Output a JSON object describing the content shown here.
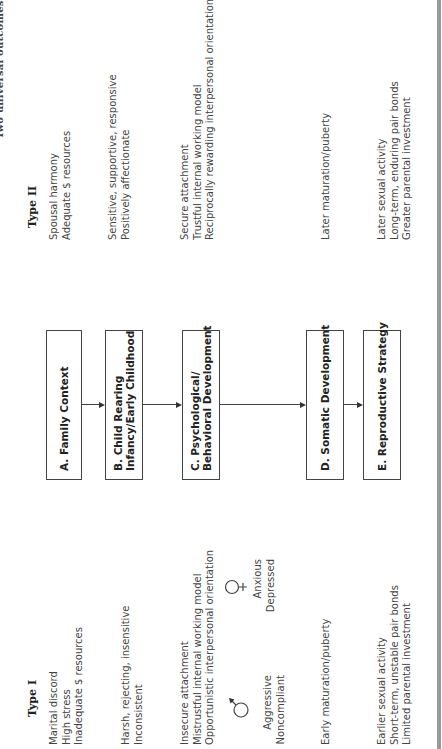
{
  "figure": {
    "title_partial": "Two universal outcomes",
    "type_i": {
      "header": "Type I",
      "family_context": [
        "Marital discord",
        "High stress",
        "Inadequate $ resources"
      ],
      "child_rearing": [
        "Harsh, rejecting, insensitive",
        "Inconsistent"
      ],
      "psychological": [
        "Insecure attachment",
        "Mistrustful internal working model",
        "Opportunistic interpersonal orientation"
      ],
      "male_symbol": "♂",
      "male_traits": [
        "Aggressive",
        "Noncompliant"
      ],
      "female_symbol": "♀",
      "female_traits": [
        "Anxious",
        "Depressed"
      ],
      "somatic": [
        "Early maturation/puberty"
      ],
      "reproductive": [
        "Earlier sexual activity",
        "Short-term, unstable pair bonds",
        "Limited parental investment"
      ]
    },
    "stages": [
      {
        "id": "A",
        "lines": [
          "A.  Family Context"
        ]
      },
      {
        "id": "B",
        "lines": [
          "B. Child Rearing",
          "Infancy/Early Childhood"
        ]
      },
      {
        "id": "C",
        "lines": [
          "C. Psychological/",
          "Behavioral Development"
        ]
      },
      {
        "id": "D",
        "lines": [
          "D. Somatic Development"
        ]
      },
      {
        "id": "E",
        "lines": [
          "E. Reproductive Strategy"
        ]
      }
    ],
    "type_ii": {
      "header": "Type II",
      "family_context": [
        "Spousal harmony",
        "Adequate $ resources"
      ],
      "child_rearing": [
        "Sensitive, supportive, responsive",
        "Positively affectionate"
      ],
      "psychological": [
        "Secure attachment",
        "Trustful internal working model",
        "Reciprocally rewarding interpersonal orientation"
      ],
      "somatic": [
        "Later maturation/puberty"
      ],
      "reproductive": [
        "Later sexual activity",
        "Long-term, enduring pair bonds",
        "Greater parental investment"
      ]
    },
    "colors": {
      "text": "#444444",
      "box_border": "#444444",
      "rule": "#999999"
    }
  }
}
